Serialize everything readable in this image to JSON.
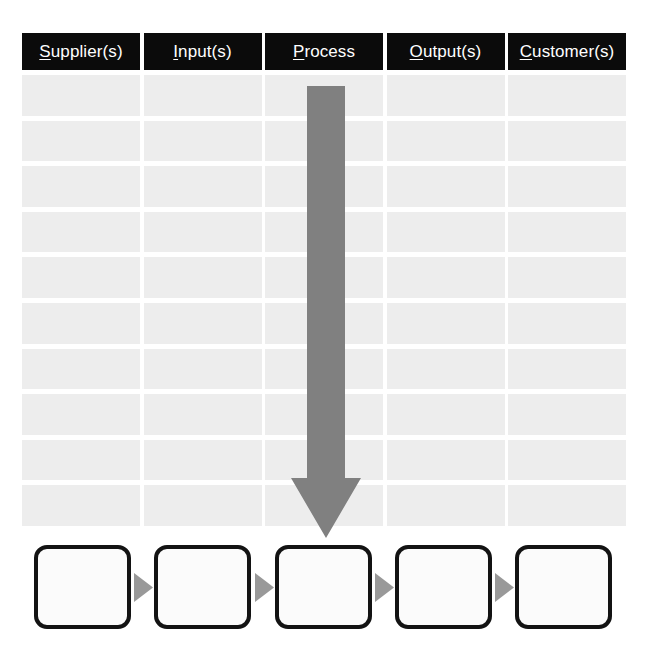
{
  "diagram": {
    "name": "SIPOC diagram template",
    "type": "sipoc",
    "background_color": "#ffffff"
  },
  "columns": [
    {
      "key": "supplier",
      "initial": "S",
      "rest": "upplier(s)",
      "label": "Supplier(s)",
      "rows": [
        "",
        "",
        "",
        "",
        "",
        "",
        "",
        "",
        "",
        ""
      ]
    },
    {
      "key": "input",
      "initial": "I",
      "rest": "nput(s)",
      "label": "Input(s)",
      "rows": [
        "",
        "",
        "",
        "",
        "",
        "",
        "",
        "",
        "",
        ""
      ]
    },
    {
      "key": "process",
      "initial": "P",
      "rest": "rocess",
      "label": "Process",
      "rows": [
        "",
        "",
        "",
        "",
        "",
        "",
        "",
        "",
        "",
        ""
      ]
    },
    {
      "key": "output",
      "initial": "O",
      "rest": "utput(s)",
      "label": "Output(s)",
      "rows": [
        "",
        "",
        "",
        "",
        "",
        "",
        "",
        "",
        "",
        ""
      ]
    },
    {
      "key": "customer",
      "initial": "C",
      "rest": "ustomer(s)",
      "label": "Customer(s)",
      "rows": [
        "",
        "",
        "",
        "",
        "",
        "",
        "",
        "",
        "",
        ""
      ]
    }
  ],
  "process_arrow": {
    "icon": "down-arrow-icon",
    "direction": "down",
    "color": "#808080"
  },
  "process_steps": {
    "boxes": [
      {
        "key": "step-1",
        "text": ""
      },
      {
        "key": "step-2",
        "text": ""
      },
      {
        "key": "step-3",
        "text": ""
      },
      {
        "key": "step-4",
        "text": ""
      },
      {
        "key": "step-5",
        "text": ""
      }
    ],
    "connector_icon": "right-triangle-icon",
    "connector_color": "#999999",
    "box_border_color": "#131313",
    "box_fill_color": "#fbfbfb"
  },
  "colors": {
    "header_background": "#0b0b0b",
    "header_text": "#ffffff",
    "cell_fill": "#ededed",
    "arrow_gray": "#808080",
    "connector_gray": "#999999"
  }
}
